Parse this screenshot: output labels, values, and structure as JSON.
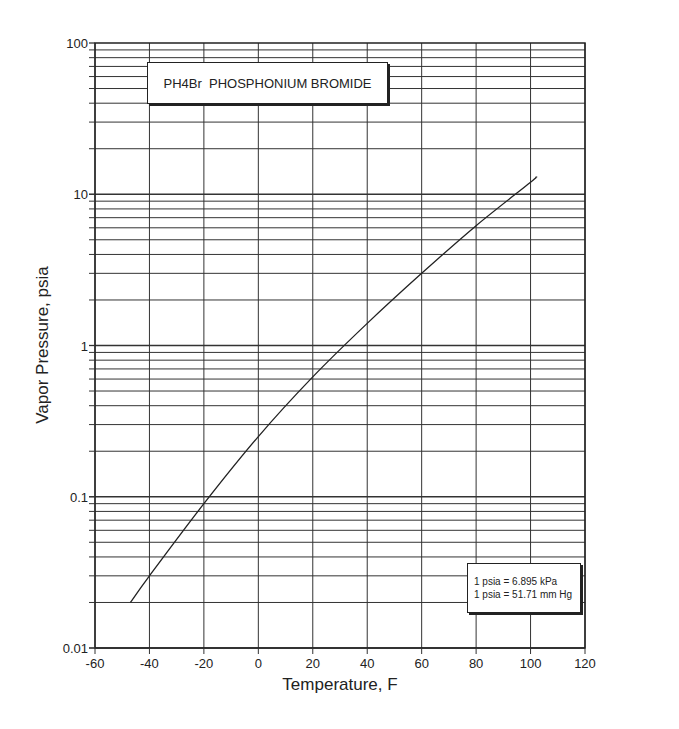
{
  "chart_data": {
    "type": "line",
    "title": "PH4Br  PHOSPHONIUM BROMIDE",
    "xlabel": "Temperature, F",
    "ylabel": "Vapor Pressure, psia",
    "xlim": [
      -60,
      120
    ],
    "ylim": [
      0.01,
      100
    ],
    "yscale": "log",
    "grid": true,
    "x_ticks": [
      "-60",
      "-40",
      "-20",
      "0",
      "20",
      "40",
      "60",
      "80",
      "100",
      "120"
    ],
    "y_ticks": [
      "0.01",
      "0.1",
      "1",
      "10",
      "100"
    ],
    "series": [
      {
        "name": "PH4Br vapor pressure",
        "x": [
          -47,
          -40,
          -20,
          0,
          20,
          40,
          60,
          80,
          100,
          102
        ],
        "y": [
          0.02,
          0.03,
          0.09,
          0.25,
          0.62,
          1.4,
          3.0,
          6.2,
          12,
          13
        ]
      }
    ],
    "annotations": [
      "1 psia = 6.895 kPa",
      "1 psia = 51.71 mm Hg"
    ]
  },
  "title_box": {
    "text": "PH4Br  PHOSPHONIUM BROMIDE"
  },
  "note_box": {
    "line1": "1 psia = 6.895 kPa",
    "line2": "1 psia = 51.71 mm Hg"
  },
  "axes": {
    "xlabel": "Temperature, F",
    "ylabel": "Vapor Pressure, psia"
  }
}
